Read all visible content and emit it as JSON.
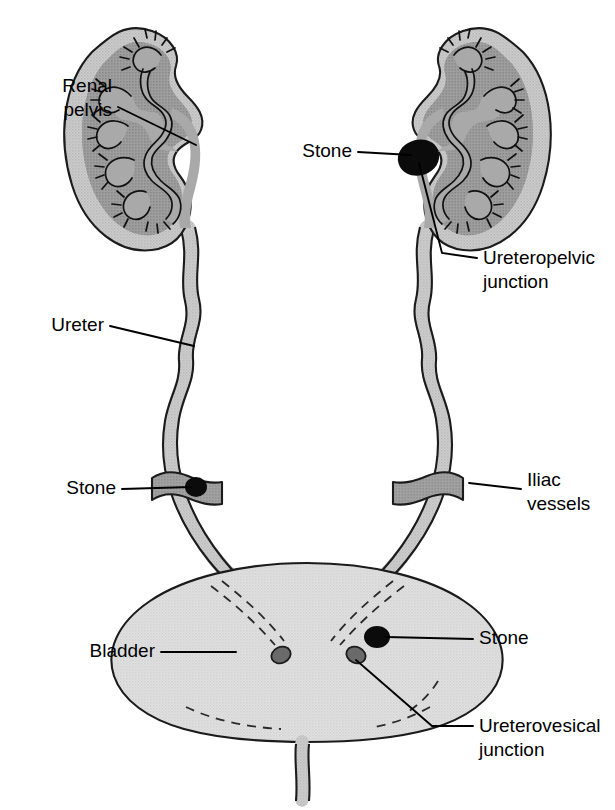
{
  "figure": {
    "type": "anatomical-diagram",
    "background_color": "#ffffff"
  },
  "palette": {
    "cortex": "#8d8d8d",
    "medulla": "#5e5e5e",
    "collecting_system": "#a9a9a9",
    "ureter": "#9b9b9b",
    "bladder": "#c9c9c9",
    "iliac_vessel": "#6f6f6f",
    "stone": "#0b0b0b",
    "orifice": "#6a6a6a",
    "outline": "#1b1b1b",
    "text": "#000000"
  },
  "labels": [
    {
      "id": "renal-pelvis",
      "text_lines": [
        "Renal",
        "pelvis"
      ],
      "align": "end",
      "x": 112,
      "y": 97
    },
    {
      "id": "stone-upj",
      "text_lines": [
        "Stone"
      ],
      "align": "end",
      "x": 352,
      "y": 152
    },
    {
      "id": "upj",
      "text_lines": [
        "Ureteropelvic",
        "junction"
      ],
      "align": "start",
      "x": 483,
      "y": 267
    },
    {
      "id": "ureter",
      "text_lines": [
        "Ureter"
      ],
      "align": "end",
      "x": 104,
      "y": 326
    },
    {
      "id": "stone-iliac",
      "text_lines": [
        "Stone"
      ],
      "align": "end",
      "x": 116,
      "y": 489
    },
    {
      "id": "iliac-vessels",
      "text_lines": [
        "Iliac",
        "vessels"
      ],
      "align": "start",
      "x": 527,
      "y": 489
    },
    {
      "id": "bladder",
      "text_lines": [
        "Bladder"
      ],
      "align": "end",
      "x": 155,
      "y": 652
    },
    {
      "id": "stone-bladder",
      "text_lines": [
        "Stone"
      ],
      "align": "start",
      "x": 479,
      "y": 639
    },
    {
      "id": "uvj",
      "text_lines": [
        "Ureterovesical",
        "junction"
      ],
      "align": "start",
      "x": 479,
      "y": 735
    }
  ],
  "structures": [
    {
      "id": "left-kidney",
      "name": "Left kidney (coronal section)",
      "side": "left"
    },
    {
      "id": "right-kidney",
      "name": "Right kidney (coronal section)",
      "side": "right"
    },
    {
      "id": "left-ureter",
      "name": "Left ureter"
    },
    {
      "id": "right-ureter",
      "name": "Right ureter"
    },
    {
      "id": "left-iliac",
      "name": "Left iliac vessels"
    },
    {
      "id": "right-iliac",
      "name": "Right iliac vessels"
    },
    {
      "id": "bladder",
      "name": "Urinary bladder"
    },
    {
      "id": "urethra",
      "name": "Urethra"
    }
  ],
  "stones": [
    {
      "id": "stone-1",
      "site": "Ureteropelvic junction",
      "x": 420,
      "y": 158
    },
    {
      "id": "stone-2",
      "site": "Iliac vessel crossing",
      "x": 196,
      "y": 487
    },
    {
      "id": "stone-3",
      "site": "Ureterovesical junction",
      "x": 377,
      "y": 637
    }
  ]
}
